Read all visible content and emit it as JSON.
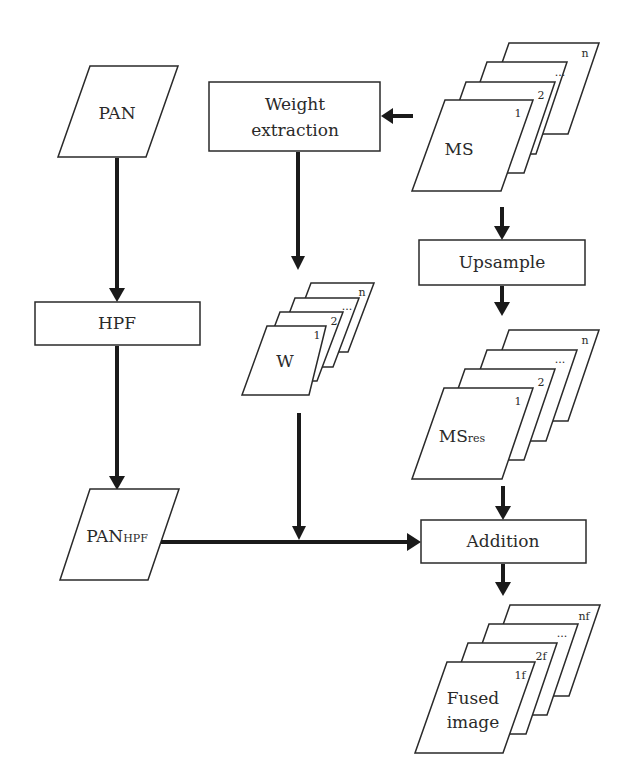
{
  "diagram": {
    "type": "flowchart",
    "nodes": {
      "pan": {
        "label": "PAN",
        "shape": "parallelogram"
      },
      "weight_extraction": {
        "line1": "Weight",
        "line2": "extraction",
        "shape": "rectangle"
      },
      "ms": {
        "label": "MS",
        "shape": "stacked-parallelogram",
        "indices": [
          "1",
          "2",
          "...",
          "n"
        ]
      },
      "upsample": {
        "label": "Upsample",
        "shape": "rectangle"
      },
      "hpf": {
        "label": "HPF",
        "shape": "rectangle"
      },
      "w": {
        "label": "W",
        "shape": "stacked-parallelogram",
        "indices": [
          "1",
          "2",
          "...",
          "n"
        ]
      },
      "ms_res": {
        "label_main": "MS",
        "label_sub": "res",
        "shape": "stacked-parallelogram",
        "indices": [
          "1",
          "2",
          "...",
          "n"
        ]
      },
      "pan_hpf": {
        "label_main": "PAN",
        "label_sub": "HPF",
        "shape": "parallelogram"
      },
      "addition": {
        "label": "Addition",
        "shape": "rectangle"
      },
      "fused": {
        "line1": "Fused",
        "line2": "image",
        "shape": "stacked-parallelogram",
        "indices": [
          "1f",
          "2f",
          "...",
          "nf"
        ]
      }
    },
    "edges": [
      {
        "from": "pan",
        "to": "hpf"
      },
      {
        "from": "hpf",
        "to": "pan_hpf"
      },
      {
        "from": "ms",
        "to": "weight_extraction"
      },
      {
        "from": "weight_extraction",
        "to": "w"
      },
      {
        "from": "ms",
        "to": "upsample"
      },
      {
        "from": "upsample",
        "to": "ms_res"
      },
      {
        "from": "w",
        "to": "addition",
        "via": "junction on PAN_HPF line"
      },
      {
        "from": "pan_hpf",
        "to": "addition"
      },
      {
        "from": "ms_res",
        "to": "addition"
      },
      {
        "from": "addition",
        "to": "fused"
      }
    ]
  }
}
